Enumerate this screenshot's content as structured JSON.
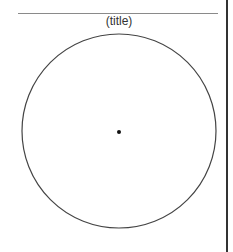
{
  "diagram": {
    "title": "(title)",
    "shapes": [
      {
        "type": "circle",
        "cx": 119,
        "cy": 131,
        "r": 97,
        "stroke": "#444444"
      },
      {
        "type": "point",
        "cx": 119,
        "cy": 132,
        "r": 2,
        "fill": "#111111"
      }
    ]
  }
}
